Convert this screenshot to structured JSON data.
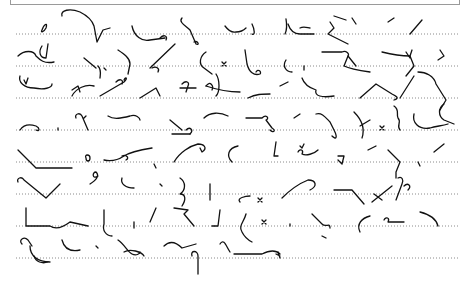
{
  "page": {
    "type": "shorthand-page",
    "ink_color": "#111111",
    "rule_color": "#8a8a8a",
    "rules": [
      {
        "y": 34,
        "x1": 16,
        "x2": 458
      },
      {
        "y": 66,
        "x1": 16,
        "x2": 458
      },
      {
        "y": 98,
        "x1": 16,
        "x2": 458
      },
      {
        "y": 130,
        "x1": 16,
        "x2": 458
      },
      {
        "y": 162,
        "x1": 16,
        "x2": 458
      },
      {
        "y": 194,
        "x1": 16,
        "x2": 458
      },
      {
        "y": 226,
        "x1": 16,
        "x2": 458
      },
      {
        "y": 258,
        "x1": 16,
        "x2": 458
      }
    ],
    "strokes": [
      {
        "d": "M42 30 C44 24 48 22 46 28 C44 32 40 33 42 30",
        "w": 1.3
      },
      {
        "d": "M62 16 C60 10 70 8 80 12 C88 16 92 20 94 26 L97 42 L103 30 L110 28",
        "w": 1.3
      },
      {
        "d": "M132 26 C134 36 142 42 150 40 L165 38",
        "w": 2.2
      },
      {
        "d": "M160 38 C164 34 168 36 166 40",
        "w": 1.3
      },
      {
        "d": "M182 18 C178 22 186 26 190 30 L196 44 C200 46 198 40 194 42",
        "w": 1.3
      },
      {
        "d": "M225 26 C228 30 232 33 236 32 C240 32 244 30 246 28",
        "w": 1.3
      },
      {
        "d": "M252 24 C255 30 255 36 252 34",
        "w": 1.3
      },
      {
        "d": "M288 24 C290 30 294 34 300 34 L314 34",
        "w": 2.4
      },
      {
        "d": "M286 19 C287 25 287 30 285 34",
        "w": 1.3
      },
      {
        "d": "M300 28 C304 26 308 28 310 28",
        "w": 1.3
      },
      {
        "d": "M330 22 L334 28 L328 34 L348 44",
        "w": 1.3
      },
      {
        "d": "M352 18 L356 24 M334 16 L346 20",
        "w": 1.3
      },
      {
        "d": "M388 22 L394 18",
        "w": 1.3
      },
      {
        "d": "M410 34 L422 20",
        "w": 1.3
      },
      {
        "d": "M18 56 C24 50 34 50 36 56 C40 60 44 64 54 62",
        "w": 1.3
      },
      {
        "d": "M42 46 C38 52 40 58 46 58 L48 44",
        "w": 1.8
      },
      {
        "d": "M84 58 L96 68",
        "w": 2.6
      },
      {
        "d": "M98 66 C102 70 100 76 100 78",
        "w": 1.3
      },
      {
        "d": "M104 68 L106 70",
        "w": 1.3
      },
      {
        "d": "M118 50 C124 54 130 58 130 64 L128 74",
        "w": 1.3
      },
      {
        "d": "M150 68 L175 44",
        "w": 1.3
      },
      {
        "d": "M152 68 C156 66 160 68 158 72",
        "w": 1.3
      },
      {
        "d": "M206 52 C200 56 198 64 204 68 L212 74",
        "w": 1.3
      },
      {
        "d": "M222 62 L226 66 M226 62 L222 66",
        "w": 1.0
      },
      {
        "d": "M245 50 L247 64 C249 72 254 76 260 74 C262 72 258 68 256 72",
        "w": 1.3
      },
      {
        "d": "M286 60 C282 66 286 72 292 72",
        "w": 1.3
      },
      {
        "d": "M304 66 L304 70",
        "w": 1.3
      },
      {
        "d": "M322 52 L342 52 C346 50 350 54 348 56 L344 66 C348 68 356 70 370 72",
        "w": 1.3
      },
      {
        "d": "M348 56 L356 66",
        "w": 1.3
      },
      {
        "d": "M382 52 C390 54 400 56 410 56 L414 66 L406 76",
        "w": 1.3
      },
      {
        "d": "M406 52 L410 58 M412 50 L410 56",
        "w": 1.0
      },
      {
        "d": "M440 50 L444 56 L438 60",
        "w": 1.8
      },
      {
        "d": "M20 76 C18 82 24 88 34 88 C44 90 52 88 52 84",
        "w": 1.3
      },
      {
        "d": "M24 80 L26 84 L28 78",
        "w": 1.0
      },
      {
        "d": "M72 96 C76 88 86 84 94 86",
        "w": 1.3
      },
      {
        "d": "M72 90 L78 86 L80 92",
        "w": 1.3
      },
      {
        "d": "M100 96 L124 82 C128 78 126 76 124 80",
        "w": 1.3
      },
      {
        "d": "M116 82 C120 78 124 80 122 84",
        "w": 1.3
      },
      {
        "d": "M140 98 L156 88 L160 96",
        "w": 2.6
      },
      {
        "d": "M182 84 C186 80 190 82 188 86 L186 92 M180 88 L196 88",
        "w": 1.3
      },
      {
        "d": "M206 86 C210 80 214 86 212 90",
        "w": 1.3
      },
      {
        "d": "M216 74 C220 80 220 92 216 96",
        "w": 1.3
      },
      {
        "d": "M206 86 C218 90 228 92 240 92",
        "w": 1.3
      },
      {
        "d": "M248 98 C256 94 262 94 270 94",
        "w": 1.3
      },
      {
        "d": "M280 86 L288 82",
        "w": 1.3
      },
      {
        "d": "M302 78 C304 84 310 88 316 90 C314 96 322 98 334 96",
        "w": 1.3
      },
      {
        "d": "M360 98 L376 84 L392 94 C396 96 400 98 394 100",
        "w": 1.3
      },
      {
        "d": "M400 98 L414 76",
        "w": 1.3
      },
      {
        "d": "M418 72 C426 72 434 76 436 84 L446 100 L440 110",
        "w": 1.3
      },
      {
        "d": "M20 130 C24 124 30 124 36 126 C40 128 40 132 36 130",
        "w": 1.3
      },
      {
        "d": "M58 128 L58 130",
        "w": 2.2
      },
      {
        "d": "M76 118 C74 114 80 112 82 116 L88 130 M84 118 L86 116",
        "w": 1.3
      },
      {
        "d": "M108 116 C114 120 122 118 130 116 C136 114 140 118 140 120",
        "w": 1.3
      },
      {
        "d": "M170 120 L182 130",
        "w": 2.6
      },
      {
        "d": "M172 134 L190 134",
        "w": 1.3
      },
      {
        "d": "M186 130 C190 126 194 130 190 134",
        "w": 1.3
      },
      {
        "d": "M204 118 C210 112 220 112 228 116",
        "w": 1.3
      },
      {
        "d": "M246 118 L262 118 C266 114 270 118 266 120 L272 128 C276 130 274 134 270 130",
        "w": 1.3
      },
      {
        "d": "M294 118 L300 114",
        "w": 1.3
      },
      {
        "d": "M316 114 C322 112 326 118 330 122 L334 130 C338 138 336 140 332 136",
        "w": 1.3
      },
      {
        "d": "M354 112 C360 118 366 126 362 138 M360 126 L370 120",
        "w": 1.3
      },
      {
        "d": "M380 126 L384 130 M384 126 L380 130",
        "w": 1.0
      },
      {
        "d": "M394 106 C400 110 396 114 398 118 C402 122 396 126 400 130",
        "w": 1.3
      },
      {
        "d": "M414 114 C412 122 418 130 430 128 C436 126 442 126 448 124",
        "w": 1.3
      },
      {
        "d": "M444 104 C438 108 438 116 444 120 L454 124",
        "w": 2.4
      },
      {
        "d": "M18 150 L36 168 L72 168",
        "w": 1.3
      },
      {
        "d": "M86 158 C84 154 90 154 90 158 C90 162 86 162 86 158",
        "w": 1.2
      },
      {
        "d": "M104 160 C112 162 118 160 124 156 C130 152 140 150 152 148",
        "w": 1.3
      },
      {
        "d": "M122 156 C126 154 130 158 126 160",
        "w": 1.2
      },
      {
        "d": "M154 164 L156 168",
        "w": 1.3
      },
      {
        "d": "M174 162 C180 152 190 146 198 144 C204 144 208 148 202 152 L200 148",
        "w": 1.3
      },
      {
        "d": "M232 162 C226 156 228 148 238 146",
        "w": 1.3
      },
      {
        "d": "M276 142 L274 156 L278 156",
        "w": 1.8
      },
      {
        "d": "M298 152 C300 148 304 150 302 154 C306 156 314 154 318 150",
        "w": 1.3
      },
      {
        "d": "M300 146 L302 148 L304 144",
        "w": 1.0
      },
      {
        "d": "M338 156 L344 156 L342 164 L338 160",
        "w": 1.3
      },
      {
        "d": "M368 150 L376 146",
        "w": 1.3
      },
      {
        "d": "M388 150 L400 162 L396 172 L396 178",
        "w": 2.6
      },
      {
        "d": "M418 162 L420 166",
        "w": 1.3
      },
      {
        "d": "M434 152 L444 144",
        "w": 1.3
      },
      {
        "d": "M18 182 C16 178 22 176 24 180 L46 198 L60 184",
        "w": 1.3
      },
      {
        "d": "M90 184 C96 180 100 176 96 172 C92 172 92 180 98 176",
        "w": 1.3
      },
      {
        "d": "M122 178 C120 184 126 188 134 188",
        "w": 1.3
      },
      {
        "d": "M160 184 L162 186",
        "w": 2.2
      },
      {
        "d": "M180 178 C186 182 186 190 180 194 C186 194 186 200 182 206",
        "w": 1.3
      },
      {
        "d": "M210 184 L210 200",
        "w": 2.8
      },
      {
        "d": "M240 202 C236 198 246 196 250 196",
        "w": 1.3
      },
      {
        "d": "M258 198 L262 202 M262 198 L258 202",
        "w": 1.0
      },
      {
        "d": "M282 198 C290 190 298 184 308 180 C316 180 318 186 310 190",
        "w": 1.3
      },
      {
        "d": "M334 190 L352 190 L364 204",
        "w": 1.3
      },
      {
        "d": "M372 202 L392 186 M374 194 L382 200",
        "w": 1.3
      },
      {
        "d": "M398 178 C402 176 404 180 402 184 L396 200",
        "w": 1.8
      },
      {
        "d": "M404 186 C408 182 412 186 408 190",
        "w": 1.0
      },
      {
        "d": "M26 208 L26 226 L50 226 C56 230 62 228 70 222 L88 226",
        "w": 1.3
      },
      {
        "d": "M104 210 L104 224 C102 230 106 236 112 236",
        "w": 1.3
      },
      {
        "d": "M134 222 L134 228",
        "w": 1.3
      },
      {
        "d": "M150 222 L156 208",
        "w": 1.3
      },
      {
        "d": "M174 208 L188 210 L184 214 L194 226",
        "w": 2.4
      },
      {
        "d": "M220 210 L218 226 L212 226",
        "w": 2.4
      },
      {
        "d": "M246 214 C244 222 238 226 242 232 C244 236 248 240 252 242",
        "w": 1.3
      },
      {
        "d": "M262 220 L266 224 M266 220 L262 224",
        "w": 1.0
      },
      {
        "d": "M290 224 L290 226",
        "w": 2.2
      },
      {
        "d": "M312 214 L322 224 C326 228 330 222 330 228",
        "w": 2.6
      },
      {
        "d": "M322 236 L326 238",
        "w": 1.0
      },
      {
        "d": "M360 232 C356 224 362 218 370 216",
        "w": 1.3
      },
      {
        "d": "M384 220 C386 216 390 218 388 222 L404 222",
        "w": 1.3
      },
      {
        "d": "M420 212 C428 214 436 218 438 226",
        "w": 1.3
      },
      {
        "d": "M22 244 C18 240 24 236 28 240 L32 246 M30 246 C30 256 38 262 50 262",
        "w": 1.3
      },
      {
        "d": "M34 256 C36 262 42 264 48 262",
        "w": 2.6
      },
      {
        "d": "M62 240 C64 248 70 252 80 250",
        "w": 1.3
      },
      {
        "d": "M96 246 L98 248",
        "w": 2.2
      },
      {
        "d": "M118 240 C124 244 128 252 132 254 C136 256 140 254 140 252",
        "w": 1.3
      },
      {
        "d": "M124 252 C130 248 142 252 144 256",
        "w": 1.3
      },
      {
        "d": "M164 246 C170 240 176 242 182 248 L196 244",
        "w": 1.3
      },
      {
        "d": "M192 256 C190 250 198 250 198 256 L198 274",
        "w": 1.3
      },
      {
        "d": "M220 244 C224 238 226 246 230 252",
        "w": 1.3
      },
      {
        "d": "M234 254 L262 254 C270 250 276 250 280 254",
        "w": 1.3
      },
      {
        "d": "M276 254 L280 256 M278 252 L280 258",
        "w": 1.0
      }
    ]
  }
}
